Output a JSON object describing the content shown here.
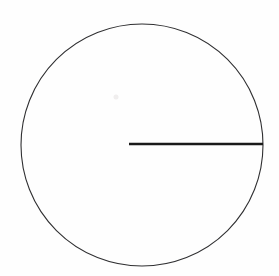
{
  "figure": {
    "background_color": "#fefefe",
    "canvas": {
      "width": 279,
      "height": 276
    },
    "shapes": {
      "circle": {
        "label": "circle outline",
        "center_x": 142,
        "center_y": 145,
        "radius": 121,
        "stroke_color": "#2f2f31",
        "stroke_width": 1.1,
        "fill": "none"
      },
      "radius_line": {
        "label": "horizontal radius segment",
        "x1": 129,
        "y1": 144,
        "x2": 263,
        "y2": 144,
        "length": 134,
        "stroke_color": "#1a1a1a",
        "stroke_width": 2.6,
        "orientation": "horizontal",
        "terminates_at": "circle right edge"
      },
      "faint_mark": {
        "label": "faint scan artifact",
        "center_x": 116,
        "center_y": 97,
        "radius": 2.5,
        "color": "#f0eeee"
      }
    }
  }
}
